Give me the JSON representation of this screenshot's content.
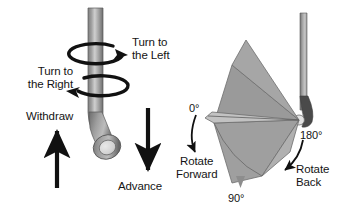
{
  "figure": {
    "background_color": "#ffffff",
    "ink_color": "#141414",
    "instrument_color_dark": "#6f6f6f",
    "instrument_color_light": "#c9c9c9",
    "sector_fill": "#9b9b9b",
    "sector_fill_light": "#b4b4b4"
  },
  "left_panel": {
    "name": "axial-rotation-and-translation",
    "labels": {
      "turn_left": "Turn to\nthe Left",
      "turn_left_line1": "Turn to",
      "turn_left_line2": "the Left",
      "turn_right_line1": "Turn to",
      "turn_right_line2": "the Right",
      "withdraw": "Withdraw",
      "advance": "Advance"
    }
  },
  "right_panel": {
    "name": "angular-rotation",
    "labels": {
      "deg_0": "0°",
      "deg_90": "90°",
      "deg_180": "180°",
      "rotate_forward_line1": "Rotate",
      "rotate_forward_line2": "Forward",
      "rotate_back_line1": "Rotate",
      "rotate_back_line2": "Back"
    }
  }
}
